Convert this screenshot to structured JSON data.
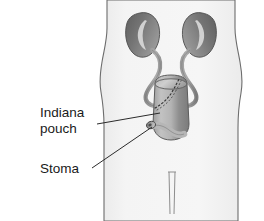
{
  "figure": {
    "background_color": "#ffffff",
    "body_fill_color": "#f1f1f1",
    "body_outline_color": "#6b6b6b",
    "organ_dark_color": "#6e6e6e",
    "organ_mid_color": "#8f8f8f",
    "organ_light_color": "#c9c9c9",
    "suture_color": "#3a3a3a",
    "leader_line_color": "#2b2b2b"
  },
  "labels": [
    {
      "id": "indiana-pouch",
      "line1": "Indiana",
      "line2": "pouch",
      "x": 40,
      "y": 117,
      "leader_from_x": 97,
      "leader_from_y": 124,
      "leader_to_x": 160,
      "leader_to_y": 113
    },
    {
      "id": "stoma",
      "line1": "Stoma",
      "line2": "",
      "x": 40,
      "y": 173,
      "leader_from_x": 92,
      "leader_from_y": 168,
      "leader_to_x": 155,
      "leader_to_y": 127
    }
  ],
  "anatomy": {
    "left_kidney": "kidney-left",
    "right_kidney": "kidney-right",
    "left_ureter": "ureter-left",
    "right_ureter": "ureter-right",
    "pouch": "indiana-pouch-reservoir",
    "stoma": "stoma-opening",
    "suture_line": "suture-line",
    "urethra_line": "urethra-line",
    "torso": "torso-silhouette"
  }
}
